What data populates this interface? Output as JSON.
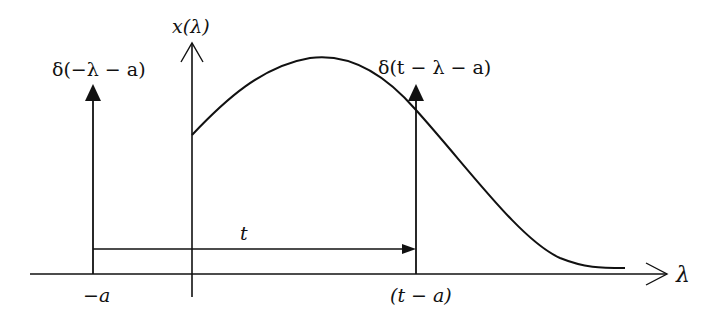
{
  "diagram": {
    "axes": {
      "horizontal_label": "λ",
      "vertical_label": "x(λ)"
    },
    "impulses": [
      {
        "label": "δ(−λ − a)",
        "position_label": "−a"
      },
      {
        "label": "δ(t − λ − a)",
        "position_label": "(t − a)"
      }
    ],
    "shift_arrow": {
      "label": "t"
    },
    "curve": {
      "name": "x(λ)",
      "color": "#111111"
    },
    "colors": {
      "stroke": "#111111",
      "background": "#ffffff"
    }
  }
}
